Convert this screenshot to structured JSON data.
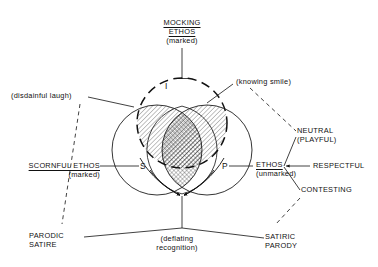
{
  "figure": {
    "title_top": {
      "line1": "MOCKING",
      "line2": "ETHOS",
      "line3": "(marked)"
    },
    "set_letters": {
      "i": "I",
      "s": "S",
      "p": "P"
    },
    "left_labels": {
      "disdainful": "(disdainful laugh)",
      "scornful_line1": "SCORNFUL ETHOS",
      "scornful_line2": "(marked)",
      "parodic_line1": "PARODIC",
      "parodic_line2": "SATIRE"
    },
    "right_labels": {
      "knowing": "(knowing smile)",
      "neutral_line1": "NEUTRAL",
      "neutral_line2": "(PLAYFUL)",
      "respectful": "RESPECTFUL",
      "contesting": "CONTESTING",
      "ethos_line1": "ETHOS",
      "ethos_line2": "(unmarked)",
      "satiric_line1": "SATIRIC",
      "satiric_line2": "PARODY"
    },
    "bottom_labels": {
      "deflating_line1": "(deflating",
      "deflating_line2": "recognition)"
    },
    "colors": {
      "ink": "#111111",
      "background": "#ffffff",
      "hatch": "#222222"
    }
  }
}
